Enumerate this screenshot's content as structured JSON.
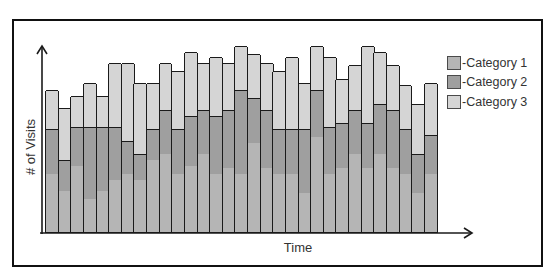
{
  "chart_data": {
    "type": "bar",
    "stacked": true,
    "title": "",
    "xlabel": "Time",
    "ylabel": "# of Visits",
    "x_ticks": [],
    "y_ticks": [],
    "grid": false,
    "legend_position": "right",
    "categories": [
      "t1",
      "t2",
      "t3",
      "t4",
      "t5",
      "t6",
      "t7",
      "t8",
      "t9",
      "t10",
      "t11",
      "t12",
      "t13",
      "t14",
      "t15",
      "t16",
      "t17",
      "t18",
      "t19",
      "t20",
      "t21",
      "t22",
      "t23",
      "t24",
      "t25",
      "t26",
      "t27",
      "t28",
      "t29",
      "t30",
      "t31"
    ],
    "series": [
      {
        "name": "-Category 1",
        "color": "#b5b5b5",
        "values": [
          3.0,
          2.1,
          3.4,
          1.7,
          2.1,
          2.7,
          3.0,
          2.7,
          3.7,
          4.0,
          3.0,
          3.4,
          4.0,
          3.0,
          3.3,
          3.0,
          4.6,
          3.3,
          3.0,
          3.0,
          2.0,
          4.9,
          3.0,
          3.3,
          4.0,
          3.3,
          4.0,
          3.3,
          3.0,
          2.0,
          3.0
        ]
      },
      {
        "name": "-Category 2",
        "color": "#9f9f9f",
        "values": [
          2.3,
          1.6,
          2.0,
          3.7,
          3.3,
          2.7,
          1.7,
          1.3,
          1.6,
          2.3,
          2.3,
          2.6,
          2.3,
          3.0,
          3.0,
          4.3,
          2.3,
          3.0,
          2.3,
          2.3,
          3.3,
          2.4,
          2.4,
          2.3,
          2.3,
          2.3,
          2.6,
          3.0,
          2.3,
          2.0,
          2.0
        ]
      },
      {
        "name": "-Category 3",
        "color": "#d5d5d5",
        "values": [
          2.0,
          2.7,
          1.6,
          2.3,
          1.6,
          3.3,
          4.0,
          3.7,
          2.4,
          2.4,
          3.0,
          3.3,
          2.4,
          3.0,
          2.4,
          2.3,
          2.3,
          2.4,
          3.0,
          3.7,
          2.4,
          2.3,
          3.6,
          2.3,
          2.3,
          4.0,
          2.7,
          2.3,
          2.3,
          2.6,
          2.7
        ]
      }
    ],
    "ylim": [
      0,
      10
    ]
  },
  "labels": {
    "xlabel": "Time",
    "ylabel": "# of Visits"
  },
  "legend": [
    {
      "label": "-Category 1",
      "color": "#b5b5b5"
    },
    {
      "label": "-Category 2",
      "color": "#9f9f9f"
    },
    {
      "label": "-Category 3",
      "color": "#d5d5d5"
    }
  ]
}
